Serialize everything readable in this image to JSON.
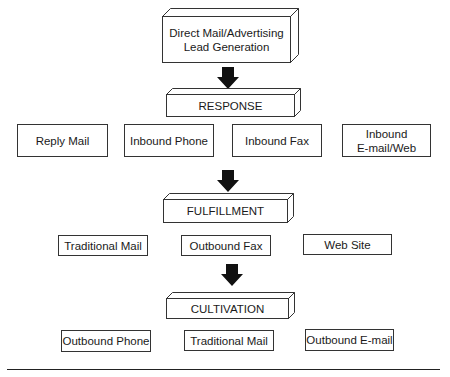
{
  "diagram": {
    "source": {
      "label": "Direct Mail/Advertising\nLead Generation"
    },
    "stages": [
      {
        "label": "RESPONSE",
        "items": [
          "Reply Mail",
          "Inbound Phone",
          "Inbound Fax",
          "Inbound\nE-mail/Web"
        ]
      },
      {
        "label": "FULFILLMENT",
        "items": [
          "Traditional Mail",
          "Outbound Fax",
          "Web Site"
        ]
      },
      {
        "label": "CULTIVATION",
        "items": [
          "Outbound Phone",
          "Traditional Mail",
          "Outbound E-mail"
        ]
      }
    ],
    "colors": {
      "stroke": "#333333",
      "arrow": "#111111",
      "background": "#ffffff"
    }
  }
}
